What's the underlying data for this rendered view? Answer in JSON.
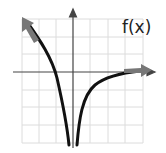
{
  "graph": {
    "function_label": "f(x)",
    "grid": {
      "columns": 7,
      "rows": 7,
      "visible": true,
      "color": "#d9d9d9"
    },
    "axes": {
      "x_axis": "horizontal with arrow pointing right",
      "y_axis": "vertical with arrow pointing up",
      "color": "#333333"
    },
    "curve": {
      "description": "Logarithmic-like curve f(x) with vertical asymptote near x=0, both branches going to negative infinity at the asymptote; left branch rises toward upper-left, right branch approaches the x-axis from below toward the right",
      "color": "#111111",
      "end_arrow_color": "#777777"
    }
  }
}
